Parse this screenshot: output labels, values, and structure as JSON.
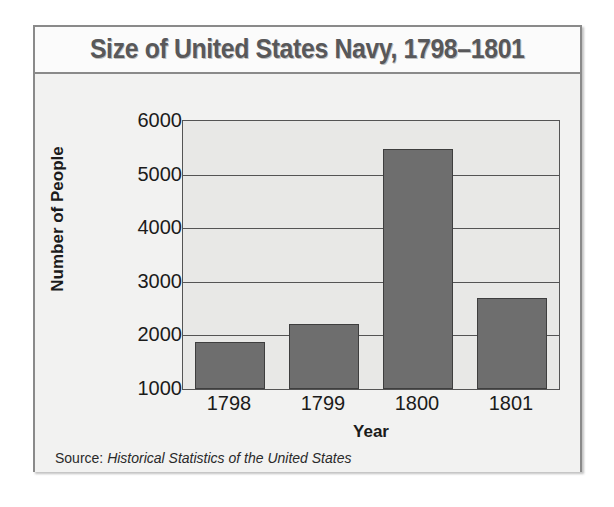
{
  "figure": {
    "title": "Size of United States Navy, 1798–1801",
    "source_label": "Source:",
    "source_value": "Historical Statistics of the United States"
  },
  "colors": {
    "bar_fill": "#6e6e6e",
    "bar_edge": "#3e3e3e",
    "plot_background": "#e8e8e6",
    "figure_background": "#f2f2f1",
    "title_text": "#58585a",
    "axis_text": "#1b1b1b",
    "gridline": "#545454"
  },
  "chart_data": {
    "type": "bar",
    "title": "Size of United States Navy, 1798–1801",
    "xlabel": "Year",
    "ylabel": "Number of People",
    "categories": [
      "1798",
      "1799",
      "1800",
      "1801"
    ],
    "values": [
      1880,
      2210,
      5480,
      2700
    ],
    "ylim": [
      1000,
      6000
    ],
    "yticks": [
      6000,
      5000,
      4000,
      3000,
      2000,
      1000
    ],
    "ytick_labels": [
      "6000",
      "5000",
      "4000",
      "3000",
      "2000",
      "1000"
    ],
    "grid": true,
    "legend": false,
    "source": "Historical Statistics of the United States"
  }
}
